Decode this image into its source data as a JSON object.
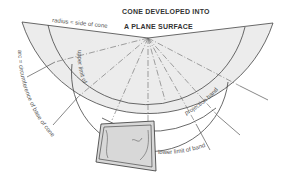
{
  "title": {
    "line1": "CONE DEVELOPED INTO",
    "line2": "A PLANE SURFACE"
  },
  "labels": {
    "radius": "radius = side of cone",
    "arc": "arc = circumference of base of cone",
    "upper_limit": "upper limit of",
    "projection_band": "projection band",
    "lower_limit": "lower limit of band"
  },
  "colors": {
    "sector_fill": "#ececec",
    "line": "#444444",
    "map_fill": "#d8d8d8"
  }
}
